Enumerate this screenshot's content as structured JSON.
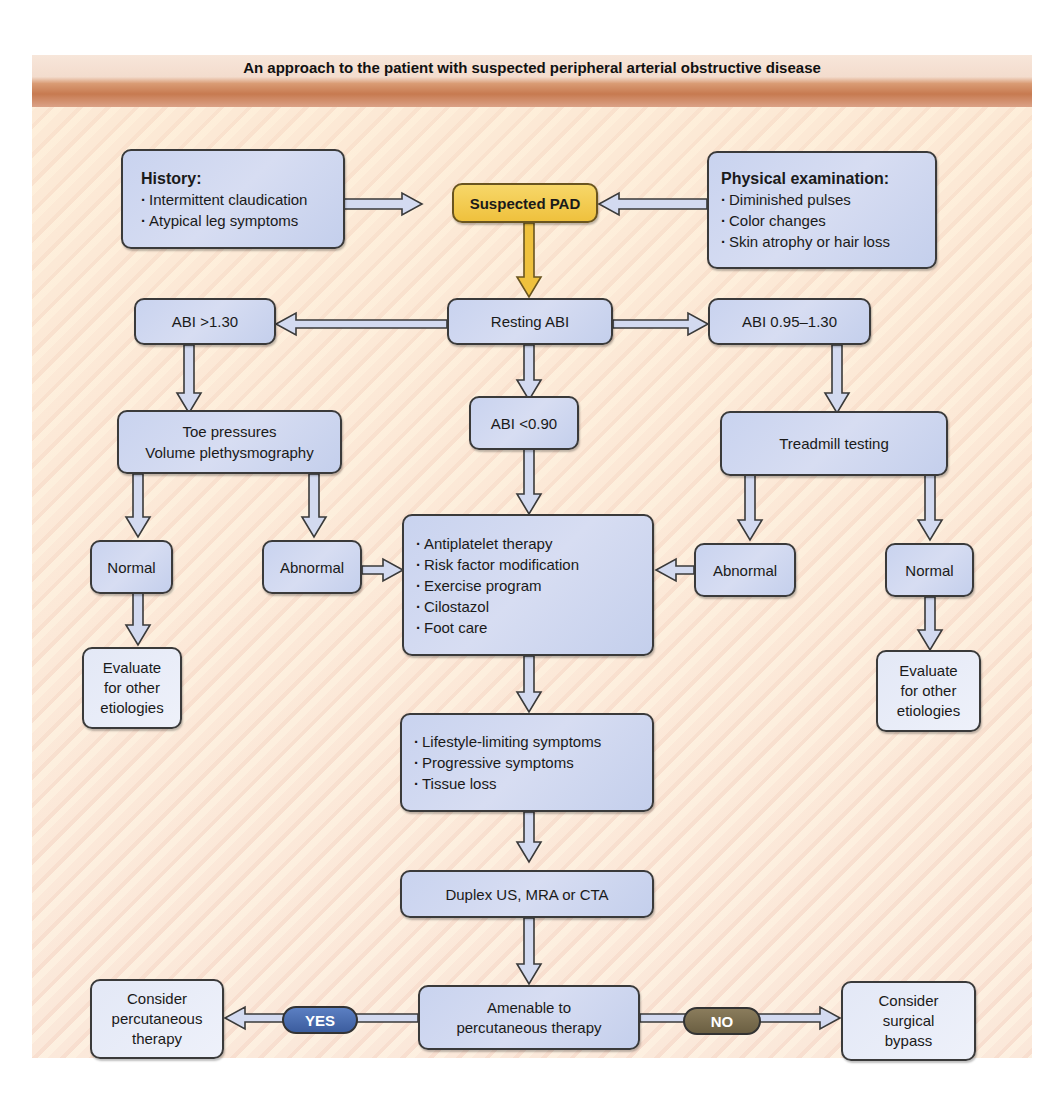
{
  "title": "An approach to the patient with suspected peripheral arterial obstructive disease",
  "colors": {
    "box_fill": "#cfd7f0",
    "box_border": "#3a3a3a",
    "start_fill": "#f2c94c",
    "yes_pill": "#4a6aad",
    "no_pill": "#7a6d4f",
    "title_band": "#c77a50",
    "background": "#fbe8dc"
  },
  "nodes": {
    "history": {
      "heading": "History:",
      "items": [
        "Intermittent claudication",
        "Atypical leg symptoms"
      ]
    },
    "suspected_pad": "Suspected PAD",
    "physical_exam": {
      "heading": "Physical examination:",
      "items": [
        "Diminished pulses",
        "Color changes",
        "Skin atrophy or hair loss"
      ]
    },
    "abi_high": "ABI >1.30",
    "resting_abi": "Resting ABI",
    "abi_normal_range": "ABI 0.95–1.30",
    "toe_pressures": [
      "Toe pressures",
      "Volume plethysmography"
    ],
    "abi_low": "ABI <0.90",
    "treadmill": "Treadmill testing",
    "left_normal": "Normal",
    "left_abnormal": "Abnormal",
    "therapy": {
      "items": [
        "Antiplatelet therapy",
        "Risk factor modification",
        "Exercise program",
        "Cilostazol",
        "Foot care"
      ]
    },
    "right_abnormal": "Abnormal",
    "right_normal": "Normal",
    "left_evaluate": [
      "Evaluate",
      "for other",
      "etiologies"
    ],
    "right_evaluate": [
      "Evaluate",
      "for other",
      "etiologies"
    ],
    "symptoms": {
      "items": [
        "Lifestyle-limiting symptoms",
        "Progressive symptoms",
        "Tissue loss"
      ]
    },
    "imaging": "Duplex US, MRA or CTA",
    "amenable": [
      "Amenable to",
      "percutaneous therapy"
    ],
    "percutaneous": [
      "Consider",
      "percutaneous",
      "therapy"
    ],
    "surgical": [
      "Consider",
      "surgical",
      "bypass"
    ]
  },
  "labels": {
    "yes": "YES",
    "no": "NO"
  }
}
